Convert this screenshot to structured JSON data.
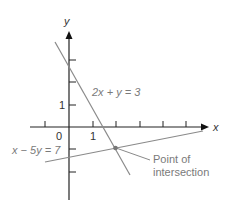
{
  "axes": {
    "x_label": "x",
    "y_label": "y",
    "origin_label": "0",
    "x_tick_label": "1",
    "y_tick_label": "1"
  },
  "lines": [
    {
      "equation": "2x + y = 3",
      "color": "#808080"
    },
    {
      "equation": "x − 5y = 7",
      "color": "#808080"
    }
  ],
  "annotation": {
    "line1": "Point of",
    "line2": "intersection"
  },
  "colors": {
    "axis": "#222222",
    "line": "#8a8a8a",
    "point": "#777777",
    "text": "#7a7a7a"
  }
}
